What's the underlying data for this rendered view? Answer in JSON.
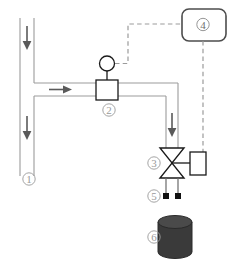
{
  "diagram": {
    "type": "piping-and-instrumentation-diagram",
    "colors": {
      "pipe": "#9b9b9b",
      "equipment_stroke": "#1a1a1a",
      "signal_dashed": "#9b9b9b",
      "label_text": "#9a9a9a",
      "arrow": "#5a5a5a",
      "tank_fill": "#3a3a3a",
      "tank_top": "#4a4a4a",
      "nozzle_tip": "#111111",
      "background": "#ffffff"
    },
    "labels": [
      {
        "id": "1",
        "glyph": "①",
        "text": "1",
        "name": "main-supply-pipe",
        "x": 29,
        "y": 179
      },
      {
        "id": "2",
        "glyph": "②",
        "text": "2",
        "name": "flow-meter",
        "x": 109,
        "y": 110
      },
      {
        "id": "3",
        "glyph": "③",
        "text": "3",
        "name": "control-valve",
        "x": 154,
        "y": 167
      },
      {
        "id": "4",
        "glyph": "④",
        "text": "4",
        "name": "controller-unit",
        "x": 203,
        "y": 28
      },
      {
        "id": "5",
        "glyph": "⑤",
        "text": "5",
        "name": "spray-nozzles",
        "x": 154,
        "y": 202
      },
      {
        "id": "6",
        "glyph": "⑥",
        "text": "6",
        "name": "collection-tank",
        "x": 154,
        "y": 237
      }
    ],
    "components": {
      "main_pipe": {
        "name": "main-vertical-pipe",
        "orientation": "vertical",
        "flow": "down"
      },
      "branch_pipe": {
        "name": "branch-horizontal-pipe",
        "orientation": "horizontal",
        "flow": "right"
      },
      "downcomer": {
        "name": "downcomer-pipe",
        "orientation": "vertical",
        "flow": "down"
      },
      "flow_meter": {
        "name": "flow-meter-body",
        "indicator": "circular-gauge"
      },
      "valve": {
        "name": "control-valve-body",
        "style": "globe-valve-bowtie"
      },
      "actuator": {
        "name": "valve-actuator",
        "style": "rectangular"
      },
      "controller": {
        "name": "controller-box",
        "style": "rounded-rectangle"
      },
      "nozzles": {
        "name": "nozzle-pair",
        "count": 2
      },
      "tank": {
        "name": "collection-tank-body",
        "style": "cylinder"
      }
    },
    "flow_arrows": [
      {
        "name": "flow-arrow-upper-main",
        "direction": "down"
      },
      {
        "name": "flow-arrow-lower-main",
        "direction": "down"
      },
      {
        "name": "flow-arrow-branch",
        "direction": "right"
      },
      {
        "name": "flow-arrow-downcomer",
        "direction": "down"
      }
    ],
    "signal_lines": [
      {
        "name": "signal-meter-to-controller",
        "style": "dashed"
      },
      {
        "name": "signal-controller-to-actuator",
        "style": "dashed"
      }
    ]
  }
}
